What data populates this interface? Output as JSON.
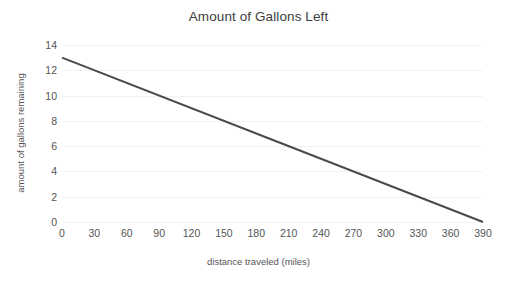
{
  "chart_data": {
    "type": "line",
    "title": "Amount of Gallons Left",
    "xlabel": "distance traveled (miles)",
    "ylabel": "amount of gallons remaining",
    "xlim": [
      0,
      390
    ],
    "ylim": [
      0,
      14
    ],
    "xticks": [
      0,
      30,
      60,
      90,
      120,
      150,
      180,
      210,
      240,
      270,
      300,
      330,
      360,
      390
    ],
    "yticks": [
      0,
      2,
      4,
      6,
      8,
      10,
      12,
      14
    ],
    "grid": "horizontal",
    "legend": "none",
    "series": [
      {
        "name": "gallons remaining",
        "color": "#4a4a4a",
        "line_width": 2,
        "x": [
          0,
          390
        ],
        "values": [
          13,
          0
        ]
      }
    ],
    "colors": {
      "line": "#4a4a4a",
      "gridline": "#f2f2f2",
      "tick_text": "#555555",
      "title_text": "#3c3c3c",
      "background": "#ffffff"
    }
  }
}
